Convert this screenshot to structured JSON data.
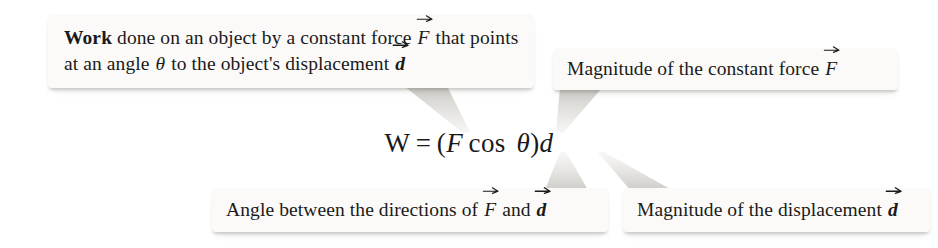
{
  "figure": {
    "kind": "annotated-equation-diagram",
    "background_color": "#ffffff",
    "callout_fill": "#fbfaf8",
    "text_color": "#1a1a1a"
  },
  "equation": {
    "full_text": "W = (F cos θ)d",
    "w": "W",
    "equals": "=",
    "open_paren": "(",
    "force_symbol": "F",
    "cos": "cos",
    "theta": "θ",
    "close_paren": ")",
    "displacement_symbol": "d"
  },
  "callouts": [
    {
      "id": "work",
      "position": "top-left",
      "lead": "Work",
      "text_part_1": " done on an object by a constant force ",
      "vector_1": "F",
      "text_part_2": " that points at an angle ",
      "theta": "θ",
      "text_part_3": " to the object's displacement ",
      "vector_2": "d",
      "plain_text": "Work done on an object by a constant force F that points at an angle θ to the object's displacement d",
      "points_to": "W"
    },
    {
      "id": "force-magnitude",
      "position": "top-right",
      "text_part_1": "Magnitude of the constant force ",
      "vector_1": "F",
      "plain_text": "Magnitude of the constant force F",
      "points_to": "F"
    },
    {
      "id": "angle",
      "position": "bottom-left",
      "text_part_1": "Angle between the directions of ",
      "vector_1": "F",
      "text_part_2": " and ",
      "vector_2": "d",
      "plain_text": "Angle between the directions of F and d",
      "points_to": "θ"
    },
    {
      "id": "displacement-magnitude",
      "position": "bottom-right",
      "text_part_1": "Magnitude of the displacement ",
      "vector_1": "d",
      "plain_text": "Magnitude of the displacement d",
      "points_to": "d"
    }
  ]
}
